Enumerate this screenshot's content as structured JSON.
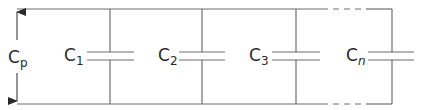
{
  "diagram": {
    "type": "parallel-capacitor-circuit",
    "total_label": {
      "main": "C",
      "sub": "p"
    },
    "capacitors": [
      {
        "main": "C",
        "sub": "1",
        "x": 110
      },
      {
        "main": "C",
        "sub": "2",
        "x": 202
      },
      {
        "main": "C",
        "sub": "3",
        "x": 296
      },
      {
        "main": "C",
        "sub": "n",
        "x": 392,
        "sub_italic": true
      }
    ],
    "colors": {
      "wire": "#6e6e6e",
      "text": "#2a2a2a",
      "background": "#ffffff"
    }
  }
}
